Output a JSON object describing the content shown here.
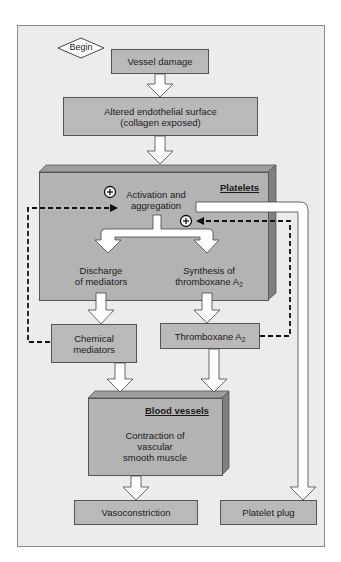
{
  "diagram": {
    "start": {
      "label": "Begin"
    },
    "nodes": {
      "vessel_damage": "Vessel damage",
      "altered_surface_line1": "Altered endothelial surface",
      "altered_surface_line2": "(collagen exposed)",
      "platelets_title": "Platelets",
      "activation_line1": "Activation and",
      "activation_line2": "aggregation",
      "discharge_line1": "Discharge",
      "discharge_line2": "of mediators",
      "synthesis_line1": "Synthesis of",
      "synthesis_line2": "thromboxane A",
      "synthesis_sub": "2",
      "chemical_line1": "Chemical",
      "chemical_line2": "mediators",
      "thromboxane": "Thromboxane A",
      "thromboxane_sub": "2",
      "blood_vessels_title": "Blood vessels",
      "contraction_line1": "Contraction of",
      "contraction_line2": "vascular",
      "contraction_line3": "smooth muscle",
      "vasoconstriction": "Vasoconstriction",
      "platelet_plug": "Platelet plug"
    },
    "feedback_symbol": "+",
    "edges": [
      {
        "from": "Begin",
        "to": "Vessel damage"
      },
      {
        "from": "Vessel damage",
        "to": "Altered endothelial surface (collagen exposed)"
      },
      {
        "from": "Altered endothelial surface (collagen exposed)",
        "to": "Platelets"
      },
      {
        "from": "Activation and aggregation",
        "to": "Discharge of mediators"
      },
      {
        "from": "Activation and aggregation",
        "to": "Synthesis of thromboxane A2"
      },
      {
        "from": "Activation and aggregation",
        "to": "Platelet plug"
      },
      {
        "from": "Discharge of mediators",
        "to": "Chemical mediators"
      },
      {
        "from": "Synthesis of thromboxane A2",
        "to": "Thromboxane A2"
      },
      {
        "from": "Chemical mediators",
        "to": "Blood vessels"
      },
      {
        "from": "Thromboxane A2",
        "to": "Blood vessels"
      },
      {
        "from": "Contraction of vascular smooth muscle",
        "to": "Vasoconstriction"
      },
      {
        "from": "Chemical mediators",
        "to": "Activation and aggregation",
        "style": "dashed",
        "sign": "+"
      },
      {
        "from": "Thromboxane A2",
        "to": "Activation and aggregation",
        "style": "dashed",
        "sign": "+"
      }
    ],
    "colors": {
      "frame_bg": "#ececec",
      "box_fill": "#b9b9b9",
      "box_side": "#8c8c8c",
      "box_top": "#9e9e9e",
      "arrow_fill": "#ffffff",
      "line": "#333333"
    }
  }
}
